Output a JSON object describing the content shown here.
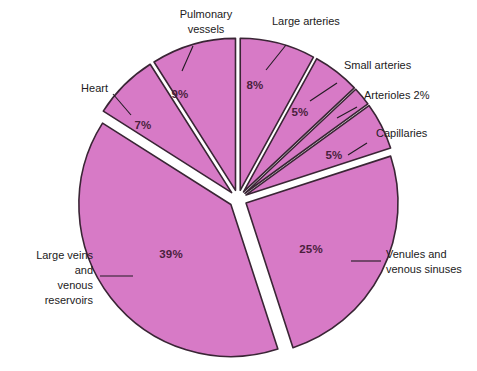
{
  "chart_data": {
    "type": "pie",
    "title": "",
    "subtitle": "",
    "xlabel": "",
    "ylabel": "",
    "legend_position": "callout-labels",
    "grid": false,
    "exploded": true,
    "units": "percent",
    "total": 100,
    "fill_color": "#d77ac6",
    "stroke_color": "#3a2535",
    "label_color": "#221a22",
    "value_label_color": "#4a1f3d",
    "background_color": "#ffffff",
    "categories": [
      "Large arteries",
      "Small arteries",
      "Arterioles",
      "Capillaries",
      "Venules and venous sinuses",
      "Large veins and venous reservoirs",
      "Heart",
      "Pulmonary vessels"
    ],
    "values": [
      8,
      5,
      2,
      5,
      25,
      39,
      7,
      9
    ],
    "slices": [
      {
        "id": "large-arteries",
        "label": "Large arteries",
        "label_lines": [
          "Large arteries"
        ],
        "value": 8,
        "value_label": "8%",
        "value_label_inside": true
      },
      {
        "id": "small-arteries",
        "label": "Small arteries",
        "label_lines": [
          "Small arteries"
        ],
        "value": 5,
        "value_label": "5%",
        "value_label_inside": true
      },
      {
        "id": "arterioles",
        "label": "Arterioles 2%",
        "label_lines": [
          "Arterioles 2%"
        ],
        "value": 2,
        "value_label": "2%",
        "value_label_inside": false
      },
      {
        "id": "capillaries",
        "label": "Capillaries",
        "label_lines": [
          "Capillaries"
        ],
        "value": 5,
        "value_label": "5%",
        "value_label_inside": true
      },
      {
        "id": "venules-venous-sinuses",
        "label": "Venules and venous sinuses",
        "label_lines": [
          "Venules and",
          "venous sinuses"
        ],
        "value": 25,
        "value_label": "25%",
        "value_label_inside": true
      },
      {
        "id": "large-veins-venous-reservoirs",
        "label": "Large veins and venous reservoirs",
        "label_lines": [
          "Large veins",
          "and",
          "venous",
          "reservoirs"
        ],
        "value": 39,
        "value_label": "39%",
        "value_label_inside": true
      },
      {
        "id": "heart",
        "label": "Heart",
        "label_lines": [
          "Heart"
        ],
        "value": 7,
        "value_label": "7%",
        "value_label_inside": true
      },
      {
        "id": "pulmonary-vessels",
        "label": "Pulmonary vessels",
        "label_lines": [
          "Pulmonary",
          "vessels"
        ],
        "value": 9,
        "value_label": "9%",
        "value_label_inside": true
      }
    ]
  },
  "labels": {
    "pulmonary_line1": "Pulmonary",
    "pulmonary_line2": "vessels",
    "large_arteries": "Large arteries",
    "small_arteries": "Small arteries",
    "arterioles": "Arterioles 2%",
    "capillaries": "Capillaries",
    "venules_line1": "Venules and",
    "venules_line2": "venous sinuses",
    "large_veins_line1": "Large veins",
    "large_veins_line2": "and",
    "large_veins_line3": "venous",
    "large_veins_line4": "reservoirs",
    "heart": "Heart"
  },
  "values": {
    "pulmonary": "9%",
    "large_arteries": "8%",
    "small_arteries": "5%",
    "capillaries": "5%",
    "venules": "25%",
    "large_veins": "39%",
    "heart": "7%"
  }
}
